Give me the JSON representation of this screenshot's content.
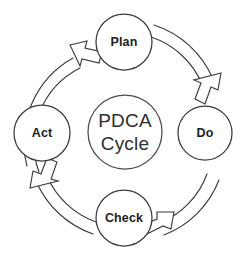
{
  "diagram": {
    "title": "PDCA Cycle",
    "type": "cycle-diagram",
    "background_color": "#ffffff",
    "stroke_color": "#3b3b3b",
    "label_color": "#1d1d1d",
    "center": {
      "line1": "PDCA",
      "line2": "Cycle"
    },
    "nodes": [
      {
        "id": "plan",
        "label": "Plan",
        "position": "top"
      },
      {
        "id": "do",
        "label": "Do",
        "position": "right"
      },
      {
        "id": "check",
        "label": "Check",
        "position": "bottom"
      },
      {
        "id": "act",
        "label": "Act",
        "position": "left"
      }
    ],
    "arrows": [
      {
        "id": "act-to-plan",
        "from": "Act",
        "to": "Plan",
        "direction": "clockwise"
      },
      {
        "id": "plan-to-do",
        "from": "Plan",
        "to": "Do",
        "direction": "clockwise"
      },
      {
        "id": "do-to-check",
        "from": "Do",
        "to": "Check",
        "direction": "clockwise"
      },
      {
        "id": "check-to-act",
        "from": "Check",
        "to": "Act",
        "direction": "clockwise"
      }
    ]
  }
}
